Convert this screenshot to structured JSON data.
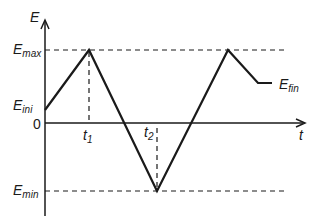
{
  "diagram": {
    "y_axis_label": "E",
    "x_axis_label": "t",
    "origin_label": "0",
    "levels": {
      "max": {
        "base": "E",
        "sub": "max"
      },
      "ini": {
        "base": "E",
        "sub": "ini"
      },
      "min": {
        "base": "E",
        "sub": "min"
      },
      "fin": {
        "base": "E",
        "sub": "fin"
      }
    },
    "time_marks": [
      {
        "base": "t",
        "sub": "1"
      },
      {
        "base": "t",
        "sub": "2"
      }
    ],
    "colors": {
      "line": "#1a1a1a",
      "background": "#ffffff"
    },
    "waveform_points": [
      [
        45,
        110
      ],
      [
        89,
        50
      ],
      [
        157,
        191
      ],
      [
        228,
        50
      ],
      [
        258,
        83
      ],
      [
        272,
        83
      ]
    ]
  }
}
